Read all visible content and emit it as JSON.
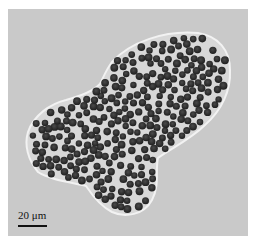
{
  "image": {
    "kind": "micrograph",
    "subject": "cluster of dark spherical cells enclosed in a translucent lobed membrane",
    "background_color": "#c9c9c9",
    "border_color": "#ffffff",
    "cell_color": "#2e2e2e",
    "membrane_color": "#e6e6e6"
  },
  "scale_bar": {
    "label": "20 μm",
    "length_px": 29
  }
}
